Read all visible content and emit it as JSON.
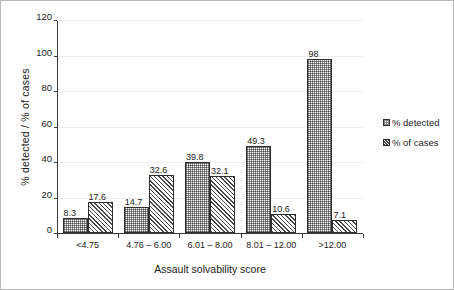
{
  "chart_data": {
    "type": "bar",
    "title": "",
    "xlabel": "Assault solvability score",
    "ylabel": "% detected / % of cases",
    "categories": [
      "<4.75",
      "4.76 – 6.00",
      "6.01 – 8.00",
      "8.01 – 12.00",
      ">12.00"
    ],
    "series": [
      {
        "name": "% detected",
        "pattern": "dotted",
        "values": [
          8.3,
          14.7,
          39.8,
          49.3,
          98
        ],
        "labels": [
          "8.3",
          "14.7",
          "39.8",
          "49.3",
          "98"
        ]
      },
      {
        "name": "% of cases",
        "pattern": "diagonal-hatch",
        "values": [
          17.6,
          32.6,
          32.1,
          10.6,
          7.1
        ],
        "labels": [
          "17.6",
          "32.6",
          "32.1",
          "10.6",
          "7.1"
        ]
      }
    ],
    "ylim": [
      0,
      120
    ],
    "yticks": [
      0,
      20,
      40,
      60,
      80,
      100,
      120
    ],
    "ytick_labels": [
      "0",
      "20",
      "40",
      "60",
      "80",
      "100",
      "120"
    ],
    "grid": true,
    "legend_position": "right",
    "legend": [
      "% detected",
      "% of cases"
    ],
    "colors": {
      "bar_outline": "#2e2e2e",
      "gridline": "#ededed",
      "axis": "#3a3a3a",
      "text": "#1b1b1b",
      "background": "#ffffff"
    }
  }
}
